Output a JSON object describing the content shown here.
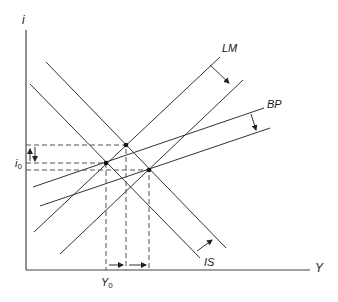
{
  "diagram": {
    "axes": {
      "y_label": "i",
      "x_label": "Y",
      "i_label_main": "i",
      "i_label_sub": "0",
      "y_label_main": "Y",
      "y_label_sub": "0"
    },
    "curves": {
      "lm_label": "LM",
      "bp_label": "BP",
      "is_label": "IS"
    },
    "colors": {
      "line": "#333333",
      "background": "#ffffff"
    }
  }
}
